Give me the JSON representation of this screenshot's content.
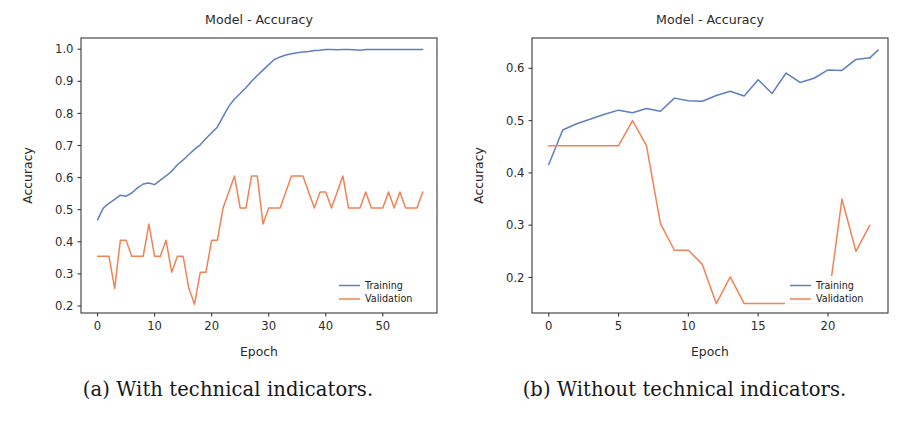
{
  "figure": {
    "panels": [
      {
        "caption": "(a) With technical indicators.",
        "chart_data": {
          "type": "line",
          "title": "Model - Accuracy",
          "xlabel": "Epoch",
          "ylabel": "Accuracy",
          "xlim": [
            -2.9,
            59.5
          ],
          "ylim": [
            0.178,
            1.035
          ],
          "xticks": [
            0,
            10,
            20,
            30,
            40,
            50
          ],
          "xticklabels": [
            "0",
            "10",
            "20",
            "30",
            "40",
            "50"
          ],
          "yticks": [
            0.2,
            0.3,
            0.4,
            0.5,
            0.6,
            0.7,
            0.8,
            0.9,
            1.0
          ],
          "yticklabels": [
            "0.2",
            "0.3",
            "0.4",
            "0.5",
            "0.6",
            "0.7",
            "0.8",
            "0.9",
            "1.0"
          ],
          "grid": false,
          "legend_position": "lower right",
          "legend_entries": [
            "Training",
            "Validation"
          ],
          "colors": {
            "training": "#5d7fc0",
            "validation": "#f08356"
          },
          "x": [
            0,
            1,
            2,
            3,
            4,
            5,
            6,
            7,
            8,
            9,
            10,
            11,
            12,
            13,
            14,
            15,
            16,
            17,
            18,
            19,
            20,
            21,
            22,
            23,
            24,
            25,
            26,
            27,
            28,
            29,
            30,
            31,
            32,
            33,
            34,
            35,
            36,
            37,
            38,
            39,
            40,
            41,
            42,
            43,
            44,
            45,
            46,
            47,
            48,
            49,
            50,
            51,
            52,
            53,
            54,
            55,
            56,
            57
          ],
          "series": [
            {
              "name": "Training",
              "color": "#5d7fc0",
              "values": [
                0.468,
                0.505,
                0.52,
                0.532,
                0.545,
                0.542,
                0.552,
                0.568,
                0.58,
                0.583,
                0.578,
                0.592,
                0.605,
                0.62,
                0.64,
                0.655,
                0.672,
                0.688,
                0.702,
                0.722,
                0.74,
                0.757,
                0.79,
                0.822,
                0.845,
                0.862,
                0.88,
                0.9,
                0.918,
                0.935,
                0.952,
                0.968,
                0.976,
                0.982,
                0.986,
                0.989,
                0.991,
                0.993,
                0.996,
                0.997,
                0.999,
                0.999,
                0.998,
                0.999,
                0.999,
                0.998,
                0.997,
                0.999,
                0.999,
                0.999,
                0.999,
                0.999,
                0.999,
                0.999,
                0.999,
                0.999,
                0.999,
                0.999
              ]
            },
            {
              "name": "Validation",
              "color": "#f08356",
              "values": [
                0.355,
                0.355,
                0.355,
                0.255,
                0.405,
                0.405,
                0.355,
                0.355,
                0.355,
                0.455,
                0.355,
                0.355,
                0.405,
                0.305,
                0.355,
                0.355,
                0.255,
                0.205,
                0.305,
                0.305,
                0.405,
                0.405,
                0.505,
                0.555,
                0.605,
                0.505,
                0.505,
                0.605,
                0.605,
                0.455,
                0.505,
                0.505,
                0.505,
                0.555,
                0.605,
                0.605,
                0.605,
                0.555,
                0.505,
                0.555,
                0.555,
                0.505,
                0.555,
                0.605,
                0.505,
                0.505,
                0.505,
                0.555,
                0.505,
                0.505,
                0.505,
                0.555,
                0.505,
                0.555,
                0.505,
                0.505,
                0.505,
                0.555
              ]
            }
          ]
        }
      },
      {
        "caption": "(b) Without technical indicators.",
        "chart_data": {
          "type": "line",
          "title": "Model - Accuracy",
          "xlabel": "Epoch",
          "ylabel": "Accuracy",
          "xlim": [
            -1.2,
            24.3
          ],
          "ylim": [
            0.132,
            0.658
          ],
          "xticks": [
            0,
            5,
            10,
            15,
            20
          ],
          "xticklabels": [
            "0",
            "5",
            "10",
            "15",
            "20"
          ],
          "yticks": [
            0.2,
            0.3,
            0.4,
            0.5,
            0.6
          ],
          "yticklabels": [
            "0.2",
            "0.3",
            "0.4",
            "0.5",
            "0.6"
          ],
          "grid": false,
          "legend_position": "lower right",
          "legend_entries": [
            "Training",
            "Validation"
          ],
          "colors": {
            "training": "#5d7fc0",
            "validation": "#f08356"
          },
          "x": [
            0,
            1,
            2,
            3,
            4,
            5,
            6,
            7,
            8,
            9,
            10,
            11,
            12,
            13,
            14,
            15,
            16,
            17,
            18,
            19,
            20,
            21,
            22,
            23
          ],
          "series": [
            {
              "name": "Training",
              "color": "#5d7fc0",
              "values": [
                0.416,
                0.482,
                0.494,
                0.503,
                0.512,
                0.52,
                0.515,
                0.523,
                0.518,
                0.543,
                0.538,
                0.537,
                0.548,
                0.556,
                0.547,
                0.578,
                0.552,
                0.591,
                0.573,
                0.581,
                0.597,
                0.596,
                0.617,
                0.62
              ]
            },
            {
              "name": "Validation",
              "color": "#f08356",
              "values": [
                0.452,
                0.452,
                0.452,
                0.452,
                0.452,
                0.452,
                0.5,
                0.452,
                0.303,
                0.252,
                0.252,
                0.225,
                0.15,
                0.201,
                0.15,
                0.15,
                0.15,
                0.15,
                0.15,
                0.15,
                0.15,
                0.35,
                0.25,
                0.3
              ]
            }
          ],
          "training_tail": {
            "x": [
              23
            ],
            "values": [
              0.635
            ]
          }
        }
      }
    ]
  }
}
